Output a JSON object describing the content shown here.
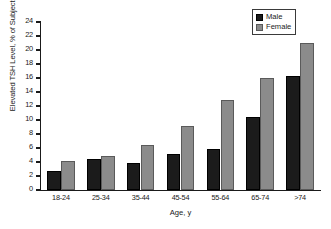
{
  "chart_data": {
    "type": "bar",
    "title": "",
    "xlabel": "Age, y",
    "ylabel": "Elevated TSH Level, % of Subjects",
    "categories": [
      "18-24",
      "25-34",
      "35-44",
      "45-54",
      "55-64",
      "65-74",
      ">74"
    ],
    "series": [
      {
        "name": "Male",
        "color": "#1b1b1b",
        "values": [
          2.7,
          4.5,
          3.9,
          5.2,
          5.8,
          10.5,
          16.3
        ]
      },
      {
        "name": "Female",
        "color": "#8b8b8b",
        "values": [
          4.1,
          4.9,
          6.4,
          9.2,
          12.8,
          16.0,
          21.0
        ]
      }
    ],
    "ylim": [
      0,
      24
    ],
    "yticks": [
      0,
      2,
      4,
      6,
      8,
      10,
      12,
      14,
      16,
      18,
      20,
      22,
      24
    ],
    "grid": false,
    "legend_position": "top-right"
  },
  "legend": {
    "entries": [
      {
        "label": "Male"
      },
      {
        "label": "Female"
      }
    ]
  }
}
